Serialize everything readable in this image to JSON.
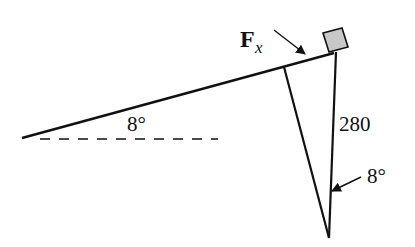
{
  "diagram": {
    "labels": {
      "force": "F",
      "force_subscript": "x",
      "incline_angle": "8°",
      "length": "280",
      "tilt_angle": "8°"
    },
    "colors": {
      "line": "#111111",
      "box_fill": "#c8c8c8",
      "background": "#ffffff"
    }
  }
}
